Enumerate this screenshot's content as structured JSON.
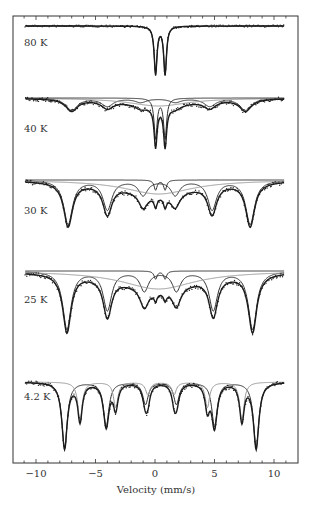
{
  "chart_data": {
    "type": "line",
    "title": "",
    "xlabel": "Velocity (mm/s)",
    "ylabel": "",
    "xlim": [
      -12,
      12
    ],
    "xticks": [
      -10,
      -5,
      0,
      5,
      10
    ],
    "xtick_labels": [
      "−10",
      "−5",
      "0",
      "5",
      "10"
    ],
    "minor_tick_step": 1,
    "grid": false,
    "legend": "none",
    "colors": {
      "frame": "#333333",
      "data": "#222222",
      "fit_total": "#1a1a1a",
      "component_dark": "#333333",
      "component_light": "#999999"
    },
    "spectra": [
      {
        "label": "80 K",
        "baseline_y": 26,
        "components": [
          {
            "kind": "doublet",
            "shade": "dark",
            "center": 0.45,
            "split": 0.8,
            "width": 0.28,
            "depth": 48
          }
        ]
      },
      {
        "label": "40 K",
        "baseline_y": 98,
        "components": [
          {
            "kind": "sextet",
            "shade": "dark",
            "center": 0.3,
            "lines": [
              -7.0,
              -4.0,
              -1.2,
              1.7,
              4.6,
              7.6
            ],
            "width": 1.2,
            "depth": 12
          },
          {
            "kind": "broad",
            "shade": "light",
            "center": 0.3,
            "width": 6.0,
            "depth": 8
          },
          {
            "kind": "doublet",
            "shade": "dark",
            "center": 0.45,
            "split": 0.8,
            "width": 0.3,
            "depth": 40
          }
        ]
      },
      {
        "label": "30 K",
        "baseline_y": 180,
        "components": [
          {
            "kind": "sextet",
            "shade": "dark",
            "center": 0.3,
            "lines": [
              -7.3,
              -4.0,
              -1.0,
              1.7,
              4.8,
              8.0
            ],
            "width": 0.9,
            "depth": 44
          },
          {
            "kind": "broad",
            "shade": "light",
            "center": 0.3,
            "width": 7.0,
            "depth": 14
          },
          {
            "kind": "doublet",
            "shade": "dark",
            "center": 0.45,
            "split": 0.8,
            "width": 0.3,
            "depth": 10
          }
        ]
      },
      {
        "label": "25 K",
        "baseline_y": 271,
        "components": [
          {
            "kind": "sextet",
            "shade": "dark",
            "center": 0.3,
            "lines": [
              -7.4,
              -4.0,
              -0.9,
              1.8,
              4.9,
              8.2
            ],
            "width": 0.85,
            "depth": 58
          },
          {
            "kind": "broad",
            "shade": "light",
            "center": 0.3,
            "width": 7.5,
            "depth": 18
          },
          {
            "kind": "doublet",
            "shade": "dark",
            "center": 0.45,
            "split": 0.8,
            "width": 0.3,
            "depth": 8
          }
        ]
      },
      {
        "label": "4.2 K",
        "baseline_y": 382,
        "components": [
          {
            "kind": "sextet",
            "shade": "dark",
            "center": 0.4,
            "lines": [
              -7.6,
              -4.1,
              -0.8,
              1.8,
              5.0,
              8.5
            ],
            "width": 0.55,
            "depth": 66
          },
          {
            "kind": "sextet",
            "shade": "light",
            "center": 0.4,
            "lines": [
              -6.3,
              -3.3,
              -0.6,
              1.6,
              4.4,
              7.3
            ],
            "width": 0.45,
            "depth": 38
          }
        ]
      }
    ]
  },
  "axes": {
    "xlabel": "Velocity (mm/s)"
  }
}
